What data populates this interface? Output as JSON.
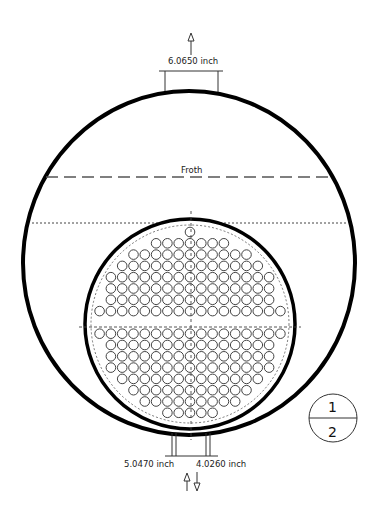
{
  "diagram": {
    "top_nozzle": {
      "label": "6.0650 inch",
      "direction": "up"
    },
    "bottom_nozzles": [
      {
        "label": "5.0470 inch",
        "direction": "up"
      },
      {
        "label": "4.0260 inch",
        "direction": "down"
      }
    ],
    "froth_label": "Froth",
    "pass_indicator": {
      "top": "1",
      "bottom": "2"
    },
    "colors": {
      "line": "#000000",
      "dashed": "#555555",
      "tube": "#444444",
      "background": "#ffffff"
    }
  }
}
